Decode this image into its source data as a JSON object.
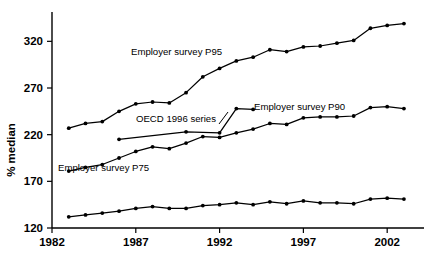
{
  "chart_data": {
    "type": "line",
    "title": "",
    "subtitle": "",
    "xlabel": "",
    "ylabel": "% median",
    "xlim": [
      1982,
      2003.6
    ],
    "ylim": [
      120,
      345
    ],
    "grid": false,
    "legend_position": "inline-annotations",
    "xticks": [
      "1982",
      "1987",
      "1992",
      "1997",
      "2002"
    ],
    "xtick_values": [
      1982,
      1987,
      1992,
      1997,
      2002
    ],
    "yticks": [
      "120",
      "170",
      "220",
      "270",
      "320"
    ],
    "ytick_values": [
      120,
      170,
      220,
      270,
      320
    ],
    "series": [
      {
        "name": "Employer survey P95",
        "label": "Employer survey P95",
        "x": [
          1983,
          1984,
          1985,
          1986,
          1987,
          1988,
          1989,
          1990,
          1991,
          1992,
          1993,
          1994,
          1995,
          1996,
          1997,
          1998,
          1999,
          2000,
          2001,
          2002,
          2003
        ],
        "values": [
          227,
          232,
          234,
          245,
          253,
          255,
          254,
          265,
          282,
          291,
          299,
          303,
          311,
          309,
          314,
          315,
          318,
          321,
          334,
          337,
          339
        ]
      },
      {
        "name": "Employer survey P90",
        "label": "Employer survey P90",
        "x": [
          1983,
          1984,
          1985,
          1986,
          1987,
          1988,
          1989,
          1990,
          1991,
          1992,
          1993,
          1994,
          1995,
          1996,
          1997,
          1998,
          1999,
          2000,
          2001,
          2002,
          2003
        ],
        "values": [
          181,
          185,
          188,
          195,
          202,
          207,
          205,
          211,
          218,
          217,
          222,
          226,
          232,
          231,
          238,
          239,
          239,
          240,
          249,
          250,
          248
        ]
      },
      {
        "name": "Employer survey P75",
        "label": "Employer survey P75",
        "x": [
          1983,
          1984,
          1985,
          1986,
          1987,
          1988,
          1989,
          1990,
          1991,
          1992,
          1993,
          1994,
          1995,
          1996,
          1997,
          1998,
          1999,
          2000,
          2001,
          2002,
          2003
        ],
        "values": [
          132,
          134,
          136,
          138,
          141,
          143,
          141,
          141,
          144,
          145,
          147,
          145,
          148,
          146,
          149,
          147,
          147,
          146,
          151,
          152,
          151
        ]
      },
      {
        "name": "OECD 1996 series",
        "label": "OECD 1996 series",
        "x": [
          1986,
          1990,
          1992,
          1993,
          1994
        ],
        "values": [
          215,
          223,
          222,
          248,
          247
        ]
      }
    ],
    "annotations": [
      {
        "text": "Employer survey P95",
        "series": "Employer survey P95"
      },
      {
        "text": "Employer survey P90",
        "series": "Employer survey P90"
      },
      {
        "text": "Employer survey P75",
        "series": "Employer survey P75"
      },
      {
        "text": "OECD 1996 series",
        "series": "OECD 1996 series"
      }
    ],
    "colors": {
      "line": "#000000",
      "marker": "#000000",
      "axis": "#000000",
      "background": "#ffffff"
    }
  }
}
